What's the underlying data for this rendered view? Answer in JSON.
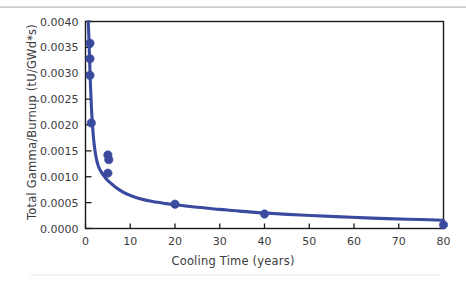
{
  "chart_data": {
    "type": "scatter",
    "title": "",
    "xlabel": "Cooling Time (years)",
    "ylabel": "Total Gamma/Burnup (tU/GWd*s)",
    "xlim": [
      0,
      80
    ],
    "ylim": [
      0.0,
      0.004
    ],
    "grid": false,
    "legend": null,
    "xticks": [
      0,
      10,
      20,
      30,
      40,
      50,
      60,
      70,
      80
    ],
    "xticklabels": [
      "0",
      "10",
      "20",
      "30",
      "40",
      "50",
      "60",
      "70",
      "80"
    ],
    "yticks": [
      0.0,
      0.0005,
      0.001,
      0.0015,
      0.002,
      0.0025,
      0.003,
      0.0035,
      0.004
    ],
    "yticklabels": [
      "0.0000",
      "0.0005",
      "0.0010",
      "0.0015",
      "0.0020",
      "0.0025",
      "0.0030",
      "0.0035",
      "0.0040"
    ],
    "series": [
      {
        "name": "Total Gamma per Burnup",
        "color": "#3a4a9f",
        "marker": "circle",
        "line": true,
        "x": [
          1.0,
          1.0,
          1.0,
          1.3,
          5.0,
          5.2,
          5.0,
          20.0,
          40.0,
          80.0
        ],
        "y": [
          0.00358,
          0.00328,
          0.00296,
          0.00204,
          0.00142,
          0.00133,
          0.00107,
          0.00047,
          0.00028,
          7e-05
        ]
      }
    ],
    "fit_curve": {
      "name": "decay-trend-line",
      "color": "#3a4a9f",
      "x": [
        0.62,
        0.75,
        0.9,
        1.05,
        1.2,
        1.4,
        1.7,
        2.0,
        2.4,
        2.9,
        3.4,
        4.0,
        4.6,
        5.2,
        6.0,
        7.0,
        8.5,
        10.0,
        12.0,
        15.0,
        18.0,
        20.0,
        25.0,
        30.0,
        35.0,
        40.0,
        48.0,
        56.0,
        64.0,
        72.0,
        80.0
      ],
      "y": [
        0.004,
        0.0037,
        0.0033,
        0.00292,
        0.00258,
        0.00222,
        0.00184,
        0.00158,
        0.00136,
        0.0012,
        0.00111,
        0.00103,
        0.00096,
        0.00091,
        0.00085,
        0.00078,
        0.0007,
        0.00064,
        0.00058,
        0.00052,
        0.00048,
        0.00046,
        0.00041,
        0.00037,
        0.00033,
        0.0003,
        0.00026,
        0.00023,
        0.0002,
        0.00018,
        0.00016
      ]
    }
  },
  "colors": {
    "series": "#3a4a9f",
    "frame": "#1a1a1a",
    "tick_text": "#3b3b3d",
    "top_rule": "#c4c4c8"
  }
}
